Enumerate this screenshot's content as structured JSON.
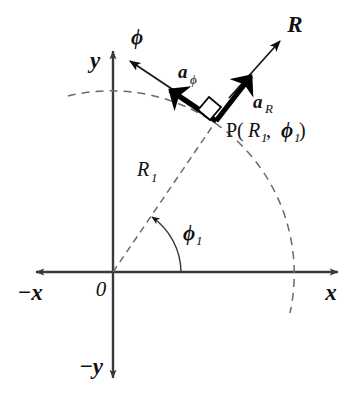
{
  "figure": {
    "kind": "polar-coordinate-unit-vector-diagram",
    "background_color": "#ffffff",
    "line_color": "#3a3a3a",
    "dash_color": "#6b6b6b",
    "vector_color": "#000000"
  },
  "axes": {
    "x_positive_label": "x",
    "x_negative_label": "−x",
    "y_positive_label": "y",
    "y_negative_label": "−y",
    "origin_label": "0"
  },
  "labels": {
    "point": "P(",
    "point_R": "R",
    "point_R_sub": "1",
    "point_comma": ", ",
    "point_phi": "ϕ",
    "point_phi_sub": "1",
    "point_close": ")",
    "radius": "R",
    "radius_sub": "1",
    "angle": "ϕ",
    "angle_sub": "1",
    "phi_direction": "ϕ",
    "R_direction": "R",
    "unit_vector_R": "a",
    "unit_vector_R_sub": "R",
    "unit_vector_phi": "a",
    "unit_vector_phi_sub": "ϕ"
  },
  "geometry": {
    "origin_x": 113,
    "origin_y": 272,
    "point_P_x": 215,
    "point_P_y": 120,
    "radius_px": 183,
    "angle_phi1_degrees": 56
  }
}
